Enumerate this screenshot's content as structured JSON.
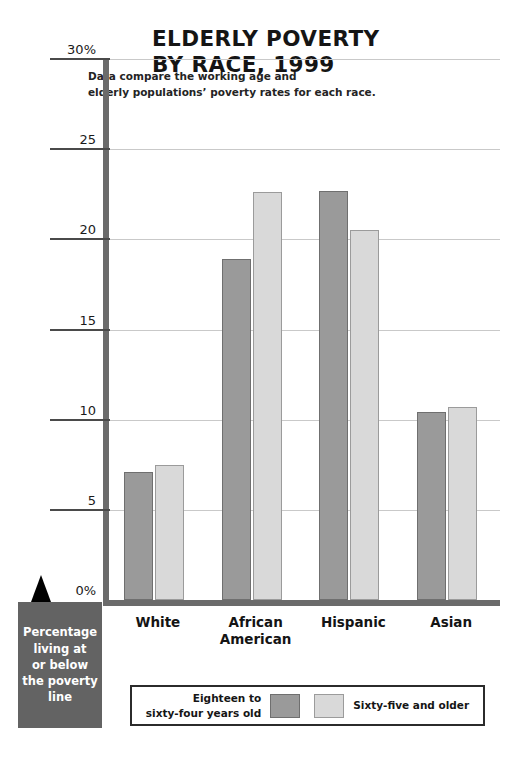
{
  "chart_data": {
    "type": "bar",
    "title": "ELDERLY POVERTY\nBY RACE, 1999",
    "subtitle": "Data compare the working age and\nelderly populations’ poverty rates for each race.",
    "categories": [
      "White",
      "African\nAmerican",
      "Hispanic",
      "Asian"
    ],
    "series": [
      {
        "name": "Eighteen to\nsixty-four years old",
        "values": [
          7.1,
          18.9,
          22.7,
          10.4
        ],
        "color": "#9a9a9a"
      },
      {
        "name": "Sixty-five and older",
        "values": [
          7.5,
          22.6,
          20.5,
          10.7
        ],
        "color": "#d9d9d9"
      }
    ],
    "xlabel": "",
    "ylabel": "Percentage living at or below the poverty line",
    "ylim": [
      0,
      30
    ],
    "yticks": [
      {
        "value": 0,
        "label": "0%"
      },
      {
        "value": 5,
        "label": "5"
      },
      {
        "value": 10,
        "label": "10"
      },
      {
        "value": 15,
        "label": "15"
      },
      {
        "value": 20,
        "label": "20"
      },
      {
        "value": 25,
        "label": "25"
      },
      {
        "value": 30,
        "label": "30%"
      }
    ],
    "grid": true,
    "legend_position": "bottom"
  },
  "callout": {
    "text": "Percentage\nliving at\nor below\nthe poverty\nline"
  },
  "legend": {
    "left_label": "Eighteen to\nsixty-four years old",
    "right_label": "Sixty-five and older"
  },
  "colors": {
    "dark_bar": "#9a9a9a",
    "light_bar": "#d9d9d9",
    "axis": "#6b6b6b",
    "gridline": "#c9c9c9",
    "callout_bg": "#636363",
    "text": "#1a1a1a"
  }
}
